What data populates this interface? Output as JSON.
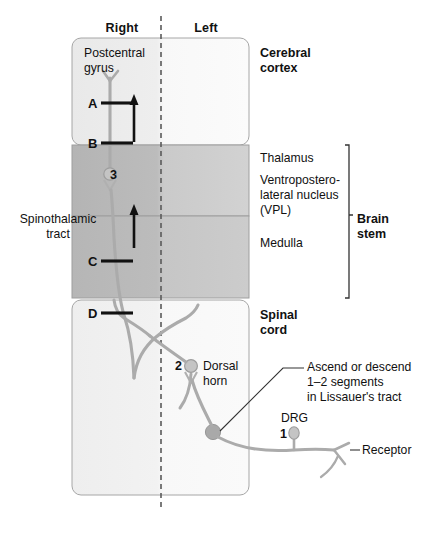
{
  "figure": {
    "side_headers": {
      "right": "Right",
      "left": "Left"
    },
    "midline": "dashed-midline"
  },
  "regions": [
    {
      "id": "cerebral-cortex",
      "label": "Cerebral\ncortex",
      "fill_right": "#ededed",
      "fill_left": "#f7f7f7"
    },
    {
      "id": "thalamus",
      "label": "Thalamus",
      "sublabel": "Ventroposterolateral nucleus\n(VPL)",
      "fill_right": "#b9b9b9",
      "fill_left": "#cfcfcf"
    },
    {
      "id": "medulla",
      "label": "Medulla",
      "fill_right": "#b9b9b9",
      "fill_left": "#c9c9c9"
    },
    {
      "id": "spinal-cord",
      "label": "Spinal\ncord",
      "fill_right": "#f2f2f2",
      "fill_left": "#f7f7f7"
    }
  ],
  "labels": {
    "cerebral_cortex": "Cerebral\ncortex",
    "thalamus": "Thalamus",
    "vpl_line1": "Ventropostero-",
    "vpl_line2": "lateral nucleus",
    "vpl_line3": "(VPL)",
    "medulla": "Medulla",
    "brain_stem": "Brain\nstem",
    "spinal_cord": "Spinal\ncord",
    "postcentral_gyrus": "Postcentral\ngyrus",
    "spinothalamic_tract": "Spinothalamic\ntract",
    "dorsal_horn": "Dorsal\nhorn",
    "lissauer_line1": "Ascend or descend",
    "lissauer_line2": "1–2 segments",
    "lissauer_line3": "in Lissauer's tract",
    "drg": "DRG",
    "receptor": "Receptor"
  },
  "markers": {
    "A": "A",
    "B": "B",
    "C": "C",
    "D": "D"
  },
  "neurons": [
    {
      "order": "1",
      "name": "first-order-neuron-drg",
      "cx": 294,
      "cy": 436
    },
    {
      "order": "2",
      "name": "second-order-neuron-dorsal-horn",
      "cx": 191,
      "cy": 367
    },
    {
      "order": "3",
      "name": "third-order-neuron-vpl",
      "cx": 110,
      "cy": 176
    }
  ],
  "colors": {
    "axon": "#a8a8a8",
    "outline": "#9a9a9a",
    "text": "#111111",
    "arrow": "#111111",
    "cortex_fill": "#ededed",
    "thalamus_fill": "#bdbdbd",
    "medulla_fill": "#bdbdbd",
    "spinal_fill": "#f2f2f2"
  }
}
